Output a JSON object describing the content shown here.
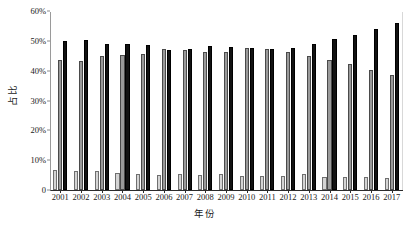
{
  "chart_data": {
    "type": "bar",
    "title": "",
    "subtitle": "",
    "xlabel": "年份",
    "ylabel": "占比",
    "grid": false,
    "legend": "none",
    "ylim": [
      0,
      60
    ],
    "y_unit": "%",
    "y_ticks": [
      0,
      10,
      20,
      30,
      40,
      50,
      60
    ],
    "y_tick_labels": [
      "0",
      "10%",
      "20%",
      "30%",
      "40%",
      "50%",
      "60%"
    ],
    "categories": [
      "2001",
      "2002",
      "2003",
      "2004",
      "2005",
      "2006",
      "2007",
      "2008",
      "2009",
      "2010",
      "2011",
      "2012",
      "2013",
      "2014",
      "2015",
      "2016",
      "2017"
    ],
    "series": [
      {
        "name": "series-1-light-gray",
        "color": "#d4d4d4",
        "values": [
          6.7,
          6.4,
          6.3,
          5.8,
          5.3,
          5.2,
          5.5,
          5.0,
          5.5,
          4.6,
          4.8,
          4.8,
          5.3,
          4.4,
          4.3,
          4.3,
          4.1
        ]
      },
      {
        "name": "series-2-medium-gray",
        "color": "#9a9a9a",
        "values": [
          43.5,
          43.2,
          44.9,
          45.2,
          45.5,
          47.2,
          46.9,
          46.1,
          46.1,
          47.7,
          47.3,
          46.3,
          44.8,
          43.5,
          42.2,
          40.2,
          38.6
        ]
      },
      {
        "name": "series-3-black",
        "color": "#121212",
        "values": [
          49.9,
          50.3,
          48.9,
          48.8,
          48.7,
          46.9,
          47.4,
          48.3,
          47.8,
          47.5,
          47.2,
          47.7,
          49.1,
          50.7,
          52.1,
          54.0,
          56.1
        ]
      }
    ]
  }
}
